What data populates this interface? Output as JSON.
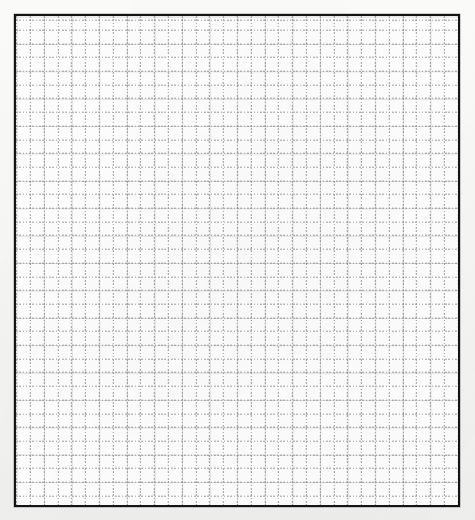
{
  "document": {
    "type": "grid-sheet",
    "title": "",
    "has_text": false,
    "content_text": ""
  },
  "canvas": {
    "width": 475,
    "height": 520,
    "outer_background_color": "#f7f7f5"
  },
  "sheet": {
    "x": 14,
    "y": 14,
    "width": 446,
    "height": 493,
    "fill_color": "#fdfdfd",
    "border_color": "#151515",
    "border_width": 2
  },
  "grid": {
    "solid_lines": {
      "color": "#d9d9d9",
      "thickness": 1,
      "column_spacing": 27.6,
      "row_spacing": 27.4,
      "column_count": 16,
      "row_count": 18
    },
    "dotted_lines": {
      "color": "#8e8e8e",
      "thickness": 1,
      "dash_length": 1.6,
      "gap_length": 1.7,
      "column_spacing": 13.8,
      "row_spacing": 13.7,
      "offset_x": 13.8,
      "offset_y": 13.7,
      "column_count": 32,
      "row_count": 36
    }
  },
  "annotations": {
    "labels": [],
    "marks": [],
    "axis_ticks": [],
    "legend": []
  }
}
